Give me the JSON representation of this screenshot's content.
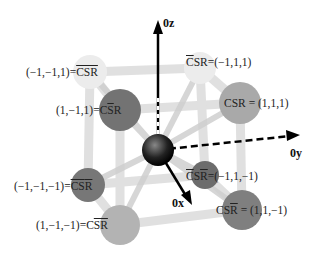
{
  "axes": {
    "z": "0z",
    "y": "0y",
    "x": "0x"
  },
  "nodes": [
    {
      "id": "n_m1m11",
      "coords": "(−1,−1,1)",
      "symbol_plain": "CSR",
      "overline": "all",
      "color": "#e4e4e4"
    },
    {
      "id": "n_m111",
      "coords": "(−1,1,1)",
      "symbol_plain": "CSR",
      "overline": "C",
      "color": "#e8e8e8"
    },
    {
      "id": "n_1m11",
      "coords": "(1,−1,1)",
      "symbol_plain": "CSR",
      "overline": "S",
      "color": "#777777"
    },
    {
      "id": "n_111",
      "coords": "(1,1,1)",
      "symbol_plain": "CSR",
      "overline": "none",
      "color": "#a8a8a8"
    },
    {
      "id": "n_m1m1m1",
      "coords": "(−1,−1,−1)",
      "symbol_plain": "CSR",
      "overline": "R",
      "color": "#7a7a7a"
    },
    {
      "id": "n_m11m1",
      "coords": "(−1,1,−1)",
      "symbol_plain": "CSR",
      "overline": "CR",
      "color": "#6e6e6e"
    },
    {
      "id": "n_1m1m1",
      "coords": "(1,−1,−1)",
      "symbol_plain": "CSR",
      "overline": "SR",
      "color": "#b0b0b0"
    },
    {
      "id": "n_11m1",
      "coords": "(1,1,−1)",
      "symbol_plain": "CSR",
      "overline": "R",
      "color": "#808080"
    }
  ],
  "labels": {
    "top_left": {
      "coords": "(−1,−1,1)",
      "eq": "=",
      "sym": "CSR"
    },
    "top_right": {
      "sym_c": "C",
      "sym_rest": "SR",
      "eq": "=",
      "coords": "(−1,1,1)"
    },
    "mid_left": {
      "coords": "(1,−1,1)",
      "eq": "=",
      "c": "C",
      "s": "S",
      "r": "R"
    },
    "mid_right": {
      "sym": "CSR",
      "eq": "=",
      "coords": "(1,1,1)"
    },
    "low_left": {
      "coords": "(−1,−1,−1)",
      "eq": "=",
      "cs": "CS",
      "r": "R"
    },
    "low_center": {
      "c": "C",
      "s": "S",
      "r": "R",
      "eq": "=",
      "coords": "(−1,1,−1)"
    },
    "bottom_left": {
      "coords": "(1,−1,−1)",
      "eq": "=",
      "c": "C",
      "sr": "SR"
    },
    "bottom_right": {
      "cs": "CS",
      "r": "R",
      "eq": "=",
      "coords": "(1,1,−1)"
    }
  }
}
